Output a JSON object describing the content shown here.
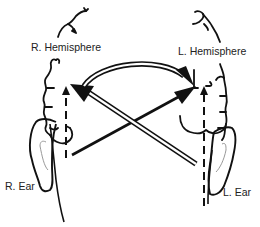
{
  "diagram": {
    "labels": {
      "right_hemisphere": "R. Hemisphere",
      "left_hemisphere": "L. Hemisphere",
      "right_ear": "R. Ear",
      "left_ear": "L. Ear"
    },
    "pathways": [
      {
        "from": "R. Ear",
        "to": "R. Hemisphere",
        "style": "dashed",
        "type": "ipsilateral"
      },
      {
        "from": "L. Ear",
        "to": "L. Hemisphere",
        "style": "dashed",
        "type": "ipsilateral"
      },
      {
        "from": "R. Ear",
        "to": "L. Hemisphere",
        "style": "solid-black",
        "type": "contralateral"
      },
      {
        "from": "L. Ear",
        "to": "R. Hemisphere",
        "style": "double-line",
        "type": "contralateral"
      },
      {
        "from": "R. Hemisphere",
        "to": "L. Hemisphere",
        "style": "double-line-curved",
        "type": "interhemispheric"
      }
    ],
    "colors": {
      "stroke": "#111111",
      "ear_inner": "#999999",
      "background": "#ffffff"
    }
  }
}
